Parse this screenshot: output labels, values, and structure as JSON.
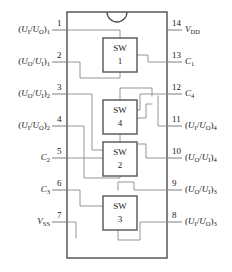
{
  "diagram": {
    "type": "ic-pinout",
    "package": "14-pin DIP",
    "notch": "top-center-semicircle",
    "switch_blocks": [
      {
        "name": "SW",
        "number": "1"
      },
      {
        "name": "SW",
        "number": "4"
      },
      {
        "name": "SW",
        "number": "2"
      },
      {
        "name": "SW",
        "number": "3"
      }
    ],
    "pins_left": [
      {
        "number": "1",
        "label_html": "(<i>U</i><sub>I</sub>/<i>U</i><sub>O</sub>)<sub>1</sub>",
        "label_text": "(UI/UO)1"
      },
      {
        "number": "2",
        "label_html": "(<i>U</i><sub>O</sub>/<i>U</i><sub>I</sub>)<sub>1</sub>",
        "label_text": "(UO/UI)1"
      },
      {
        "number": "3",
        "label_html": "(<i>U</i><sub>O</sub>/<i>U</i><sub>I</sub>)<sub>2</sub>",
        "label_text": "(UO/UI)2"
      },
      {
        "number": "4",
        "label_html": "(<i>U</i><sub>I</sub>/<i>U</i><sub>O</sub>)<sub>2</sub>",
        "label_text": "(UI/UO)2"
      },
      {
        "number": "5",
        "label_html": "<i>C</i><sub>2</sub>",
        "label_text": "C2"
      },
      {
        "number": "6",
        "label_html": "<i>C</i><sub>3</sub>",
        "label_text": "C3"
      },
      {
        "number": "7",
        "label_html": "<i>V</i><sub>SS</sub>",
        "label_text": "VSS"
      }
    ],
    "pins_right": [
      {
        "number": "14",
        "label_html": "<i>V</i><sub>DD</sub>",
        "label_text": "VDD"
      },
      {
        "number": "13",
        "label_html": "<i>C</i><sub>1</sub>",
        "label_text": "C1"
      },
      {
        "number": "12",
        "label_html": "<i>C</i><sub>4</sub>",
        "label_text": "C4"
      },
      {
        "number": "11",
        "label_html": "(<i>U</i><sub>I</sub>/<i>U</i><sub>O</sub>)<sub>4</sub>",
        "label_text": "(UI/UO)4"
      },
      {
        "number": "10",
        "label_html": "(<i>U</i><sub>O</sub>/<i>U</i><sub>I</sub>)<sub>4</sub>",
        "label_text": "(UO/UI)4"
      },
      {
        "number": "9",
        "label_html": "(<i>U</i><sub>O</sub>/<i>U</i><sub>I</sub>)<sub>3</sub>",
        "label_text": "(UO/UI)3"
      },
      {
        "number": "8",
        "label_html": "(<i>U</i><sub>I</sub>/<i>U</i><sub>O</sub>)<sub>3</sub>",
        "label_text": "(UI/UO)3"
      }
    ],
    "colors": {
      "background": "#ffffff",
      "body_outline": "#4d4d4d",
      "wire": "#8a8a8a",
      "box_outline": "#555555",
      "text": "#1a1a1a"
    }
  }
}
